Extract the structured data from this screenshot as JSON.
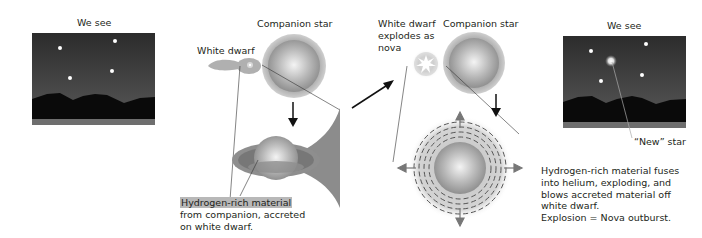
{
  "panels": {
    "left_sky": {
      "title": "We see"
    },
    "stage1": {
      "companion_label": "Companion star",
      "white_dwarf_label": "White dwarf",
      "caption": {
        "highlight": "Hydrogen-rich material",
        "line2": "from companion, accreted",
        "line3": "on white dwarf."
      }
    },
    "stage2": {
      "white_dwarf_label": {
        "line1": "White dwarf",
        "line2": "explodes as",
        "line3": "nova"
      },
      "companion_label": "Companion star",
      "caption": {
        "line1": "Hydrogen-rich material fuses",
        "line2": "into helium, exploding, and",
        "line3": "blows accreted material off",
        "line4": "white dwarf.",
        "line5": "Explosion = Nova outburst."
      }
    },
    "right_sky": {
      "title": "We see",
      "new_star_label": "“New” star"
    }
  },
  "colors": {
    "sky_top": "#2a2a2a",
    "sky_bottom": "#555555",
    "mountains": "#0a0a0a",
    "ground": "#6e6e6e",
    "star_gray": "#9a9a9a",
    "accretion": "#8c8c8c",
    "highlight": "#b8b8b8"
  }
}
